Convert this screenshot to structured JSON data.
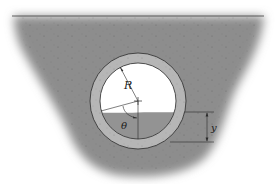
{
  "figure": {
    "labels": {
      "radius": "R",
      "angle": "θ",
      "depth": "y"
    },
    "colors": {
      "soil": "#8c8c8c",
      "pipe_wall": "#b4b4b4",
      "pipe_interior": "#ffffff",
      "liquid": "#8f8f8f",
      "lines": "#2a2a2a",
      "background": "#ffffff"
    }
  }
}
